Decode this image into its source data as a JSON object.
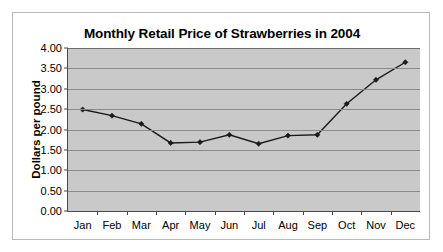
{
  "chart_data": {
    "type": "line",
    "title": "Monthly Retail Price of Strawberries in 2004",
    "xlabel": "",
    "ylabel": "Dollars per pound",
    "categories": [
      "Jan",
      "Feb",
      "Mar",
      "Apr",
      "May",
      "Jun",
      "Jul",
      "Aug",
      "Sep",
      "Oct",
      "Nov",
      "Dec"
    ],
    "values": [
      2.49,
      2.34,
      2.14,
      1.67,
      1.69,
      1.87,
      1.65,
      1.85,
      1.87,
      2.63,
      3.22,
      3.65
    ],
    "series": [
      {
        "name": "Retail price",
        "values": [
          2.49,
          2.34,
          2.14,
          1.67,
          1.69,
          1.87,
          1.65,
          1.85,
          1.87,
          2.63,
          3.22,
          3.65
        ]
      }
    ],
    "ylim": [
      0.0,
      4.0
    ],
    "ytick_step": 0.5,
    "ytick_labels": [
      "4.00",
      "3.50",
      "3.00",
      "2.50",
      "2.00",
      "1.50",
      "1.00",
      "0.50",
      "0.00"
    ],
    "ytick_values": [
      4.0,
      3.5,
      3.0,
      2.5,
      2.0,
      1.5,
      1.0,
      0.5,
      0.0
    ],
    "grid": true,
    "legend": false,
    "legend_position": "none",
    "marker": "diamond",
    "line_color": "#1a1a1a",
    "plot_background": "#c9c9c9",
    "gridline_color": "#8a8a8a",
    "axis_color": "#4a4a4a",
    "frame_background": "#ffffff",
    "frame_border_color": "#b9b9b9"
  }
}
